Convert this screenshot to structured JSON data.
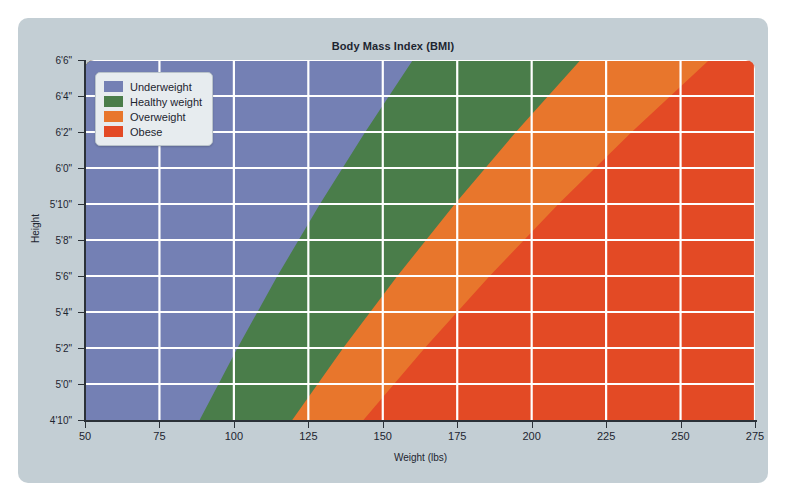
{
  "chart_data": {
    "type": "area",
    "title": "Body Mass Index (BMI)",
    "xlabel": "Weight (lbs)",
    "ylabel": "Height",
    "xlim": [
      50,
      275
    ],
    "ylim": [
      58,
      78
    ],
    "grid": true,
    "legend_position": "top-left",
    "xticks": [
      50,
      75,
      100,
      125,
      150,
      175,
      200,
      225,
      250,
      275
    ],
    "xtick_labels": [
      "50",
      "75",
      "100",
      "125",
      "150",
      "175",
      "200",
      "225",
      "250",
      "275"
    ],
    "yticks": [
      78,
      76,
      74,
      72,
      70,
      68,
      66,
      64,
      62,
      60,
      58
    ],
    "ytick_labels": [
      "6'6\"",
      "6'4\"",
      "6'2\"",
      "6'0\"",
      "5'10\"",
      "5'8\"",
      "5'6\"",
      "5'4\"",
      "5'2\"",
      "5'0\"",
      "4'10\""
    ],
    "series": [
      {
        "name": "Underweight",
        "color": "#7480b4",
        "bmi_range": [
          0,
          18.5
        ],
        "boundary_weights_lbs": [
          {
            "height_in": 58,
            "weight": 88.5
          },
          {
            "height_in": 62,
            "weight": 101.2
          },
          {
            "height_in": 66,
            "weight": 114.6
          },
          {
            "height_in": 70,
            "weight": 128.9
          },
          {
            "height_in": 74,
            "weight": 144.1
          },
          {
            "height_in": 78,
            "weight": 160.1
          }
        ]
      },
      {
        "name": "Healthy weight",
        "color": "#4a7d4a",
        "bmi_range": [
          18.5,
          25
        ],
        "boundary_weights_lbs": [
          {
            "height_in": 58,
            "weight": 119.6
          },
          {
            "height_in": 62,
            "weight": 136.7
          },
          {
            "height_in": 66,
            "weight": 154.9
          },
          {
            "height_in": 70,
            "weight": 174.2
          },
          {
            "height_in": 74,
            "weight": 194.7
          },
          {
            "height_in": 78,
            "weight": 216.4
          }
        ]
      },
      {
        "name": "Overweight",
        "color": "#e8762c",
        "bmi_range": [
          25,
          30
        ],
        "boundary_weights_lbs": [
          {
            "height_in": 58,
            "weight": 143.5
          },
          {
            "height_in": 62,
            "weight": 164.1
          },
          {
            "height_in": 66,
            "weight": 185.9
          },
          {
            "height_in": 70,
            "weight": 209.0
          },
          {
            "height_in": 74,
            "weight": 233.6
          },
          {
            "height_in": 78,
            "weight": 259.6
          }
        ]
      },
      {
        "name": "Obese",
        "color": "#e34a25",
        "bmi_range": [
          30,
          100
        ],
        "boundary_weights_lbs": []
      }
    ]
  },
  "legend": {
    "items": [
      {
        "label": "Underweight",
        "color": "#7480b4"
      },
      {
        "label": "Healthy weight",
        "color": "#4a7d4a"
      },
      {
        "label": "Overweight",
        "color": "#e8762c"
      },
      {
        "label": "Obese",
        "color": "#e34a25"
      }
    ]
  },
  "style": {
    "panel_bg": "#c3ced4",
    "gridline_color": "#ffffff",
    "axis_color": "#2b3138",
    "text_color": "#1d2530"
  }
}
